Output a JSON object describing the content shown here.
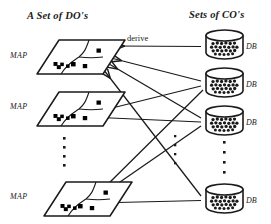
{
  "figure": {
    "headers": {
      "left": "A Set of DO's",
      "right": "Sets of CO's"
    },
    "edge_label": "derive",
    "map_label": "MAP",
    "db_label": "DB",
    "colors": {
      "ink": "#1a1a1a",
      "background": "#ffffff"
    },
    "maps": [
      {
        "label": "MAP"
      },
      {
        "label": "MAP"
      },
      {
        "label": "MAP"
      }
    ],
    "databases": [
      {
        "label": "DB"
      },
      {
        "label": "DB"
      },
      {
        "label": "DB"
      },
      {
        "label": "DB"
      }
    ],
    "ellipsis": {
      "left": "⋮",
      "right": "⋮",
      "middle": "⋮"
    }
  }
}
